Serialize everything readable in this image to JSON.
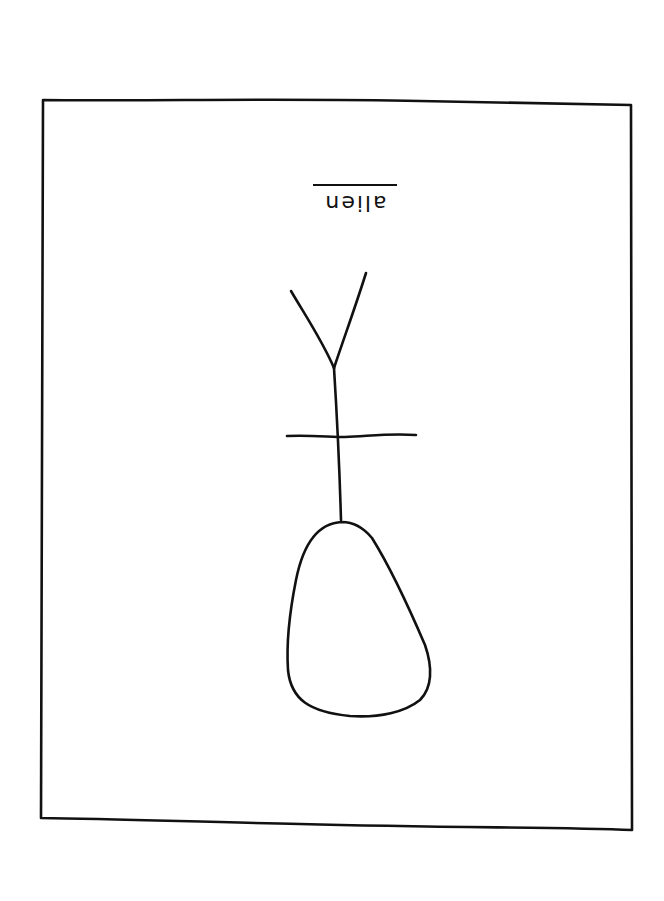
{
  "drawing": {
    "type": "hand-drawn sketch",
    "label_text": "alien",
    "label_orientation": "upside-down (rotated 180°)",
    "label_underlined": true,
    "stroke_color": "#111111",
    "background_color": "#ffffff",
    "elements": [
      "rectangular frame border",
      "label 'alien'",
      "Y-shaped antenna",
      "vertical stem",
      "horizontal crossbar",
      "egg-shaped head / body"
    ]
  }
}
